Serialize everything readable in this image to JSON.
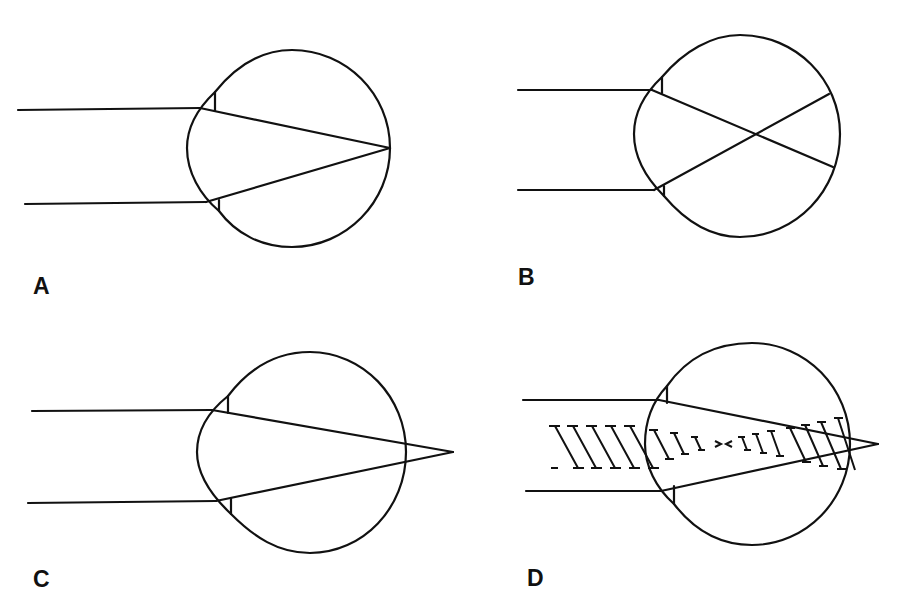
{
  "figure": {
    "colors": {
      "ink": "#111111",
      "background": "#ffffff"
    },
    "panels": [
      {
        "id": "A",
        "label": "A",
        "label_pos": {
          "x": 33,
          "y": 275
        },
        "description": "Parallel rays converge to a focal point on the retina",
        "eye": {
          "cx": 289,
          "cy": 146,
          "rx": 103,
          "ry": 101
        },
        "rays": {
          "upper_y": 108,
          "lower_y": 203,
          "start_x_upper": 18,
          "start_x_lower": 25,
          "entry_x": 200,
          "focus": {
            "x": 390,
            "y": 148
          }
        }
      },
      {
        "id": "B",
        "label": "B",
        "label_pos": {
          "x": 518,
          "y": 266
        },
        "description": "Rays cross inside the globe, in front of the retina",
        "eye": {
          "cx": 744,
          "cy": 136,
          "rx": 103,
          "ry": 101
        },
        "rays": {
          "upper_y": 90,
          "lower_y": 190,
          "start_x": 518,
          "entry_x": 652,
          "cross": {
            "x": 753,
            "y": 134
          },
          "end_upper": {
            "x": 833,
            "y": 167
          },
          "end_lower": {
            "x": 829,
            "y": 94
          }
        }
      },
      {
        "id": "C",
        "label": "C",
        "label_pos": {
          "x": 33,
          "y": 568
        },
        "description": "Rays converge to a point behind the retina",
        "eye": {
          "cx": 307,
          "cy": 453,
          "rx": 103,
          "ry": 101
        },
        "rays": {
          "upper_y": 410,
          "lower_y": 502,
          "start_x_upper": 32,
          "start_x_lower": 28,
          "entry_x": 212,
          "focus": {
            "x": 453,
            "y": 452
          }
        }
      },
      {
        "id": "D",
        "label": "D",
        "label_pos": {
          "x": 527,
          "y": 567
        },
        "description": "Smeared, uneven focus shown with hatching across the ray bundle",
        "eye": {
          "cx": 752,
          "cy": 444,
          "rx": 100,
          "ry": 101
        },
        "rays": {
          "upper_y": 400,
          "lower_y": 491,
          "start_x_upper": 523,
          "start_x_lower": 526,
          "entry_x": 659,
          "focus": {
            "x": 878,
            "y": 444
          }
        }
      }
    ]
  }
}
